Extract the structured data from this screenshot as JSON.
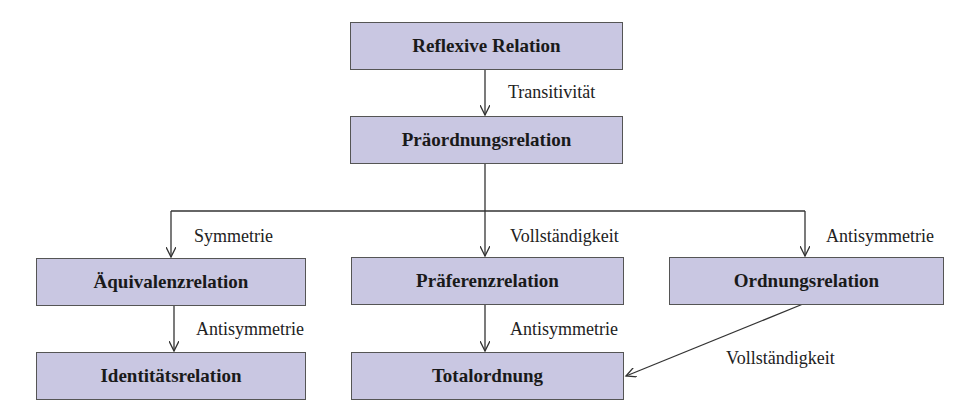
{
  "nodes": {
    "reflexive": "Reflexive Relation",
    "preorder": "Präordnungsrelation",
    "equivalence": "Äquivalenzrelation",
    "preference": "Präferenzrelation",
    "order": "Ordnungsrelation",
    "identity": "Identitätsrelation",
    "total": "Totalordnung"
  },
  "edges": {
    "reflexive_preorder": "Transitivität",
    "preorder_equivalence": "Symmetrie",
    "preorder_preference": "Vollständigkeit",
    "preorder_order": "Antisymmetrie",
    "equivalence_identity": "Antisymmetrie",
    "preference_total": "Antisymmetrie",
    "order_total": "Vollständigkeit"
  },
  "colors": {
    "box_fill": "#c9c7e2",
    "line": "#333333"
  }
}
